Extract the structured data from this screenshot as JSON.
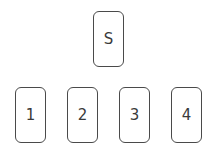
{
  "diagram": {
    "top": {
      "label": "S",
      "x": 93,
      "y": 11
    },
    "bottom": [
      {
        "label": "1",
        "x": 15,
        "y": 87
      },
      {
        "label": "2",
        "x": 67,
        "y": 87
      },
      {
        "label": "3",
        "x": 119,
        "y": 87
      },
      {
        "label": "4",
        "x": 171,
        "y": 87
      }
    ]
  }
}
